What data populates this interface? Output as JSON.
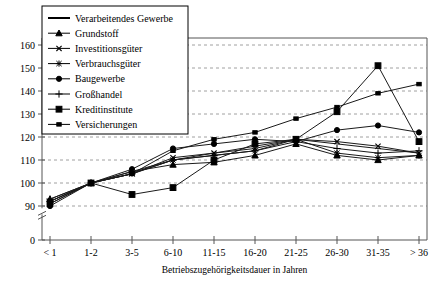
{
  "chart_data": {
    "type": "line",
    "title": "",
    "xlabel": "Betriebszugehörigkeitsdauer in Jahren",
    "ylabel": "",
    "categories": [
      "< 1",
      "1-2",
      "3-5",
      "6-10",
      "11-15",
      "16-20",
      "21-25",
      "26-30",
      "31-35",
      "> 36"
    ],
    "ylim": [
      88,
      165
    ],
    "yticks": [
      0,
      90,
      100,
      110,
      120,
      130,
      140,
      150,
      160
    ],
    "ytick_labels": [
      "0",
      "90",
      "100",
      "110",
      "120",
      "130",
      "140",
      "150",
      "160"
    ],
    "axis_break": true,
    "grid": "horizontal-dashed",
    "legend_position": "top-left",
    "series": [
      {
        "name": "Verarbeitendes Gewerbe",
        "marker": "none",
        "values": [
          92,
          100,
          104,
          110,
          113,
          116,
          119,
          117,
          115,
          113
        ]
      },
      {
        "name": "Grundstoff",
        "marker": "triangle",
        "values": [
          93,
          100,
          105,
          108,
          109,
          112,
          117,
          112,
          110,
          112
        ]
      },
      {
        "name": "Investitionsgüter",
        "marker": "cross-x",
        "values": [
          91,
          100,
          104,
          111,
          113,
          115,
          119,
          118,
          116,
          113
        ]
      },
      {
        "name": "Verbrauchsgüter",
        "marker": "star-x",
        "values": [
          92,
          100,
          104,
          110,
          112,
          114,
          119,
          113,
          111,
          112
        ]
      },
      {
        "name": "Baugewerbe",
        "marker": "circle",
        "values": [
          90,
          100,
          106,
          115,
          117,
          119,
          118,
          123,
          125,
          122
        ]
      },
      {
        "name": "Großhandel",
        "marker": "plus",
        "values": [
          93,
          100,
          105,
          110,
          112,
          114,
          118,
          115,
          113,
          114
        ]
      },
      {
        "name": "Kreditinstitute",
        "marker": "square",
        "values": [
          91,
          100,
          95,
          98,
          110,
          117,
          119,
          131,
          151,
          118
        ]
      },
      {
        "name": "Versicherungen",
        "marker": "square-small",
        "values": [
          92,
          100,
          104,
          114,
          119,
          122,
          128,
          133,
          139,
          143
        ]
      }
    ]
  }
}
